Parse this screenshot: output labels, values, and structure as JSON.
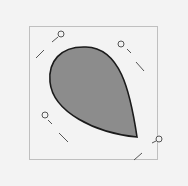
{
  "canvas": {
    "background": "#f3f3f3",
    "bounding_box": {
      "x": 29.5,
      "y": 26.5,
      "w": 128,
      "h": 133,
      "stroke": "#8a8a8a"
    },
    "shape": {
      "name": "teardrop",
      "fill": "#8c8c8c",
      "stroke": "#1a1a1a",
      "path": "M137,137 C130,90 120,48 86,47 C60,46 48,62 50,82 C53,112 95,133 137,137 Z"
    },
    "handles": [
      {
        "name": "handle-top-left",
        "line": [
          36,
          58,
          44,
          50
        ],
        "line2": [
          52,
          42,
          58,
          37
        ],
        "knob": [
          61,
          34
        ]
      },
      {
        "name": "handle-top-right",
        "line": [
          127,
          49,
          131,
          53
        ],
        "line2": [
          136,
          62,
          144,
          71
        ],
        "knob": [
          121,
          44
        ]
      },
      {
        "name": "handle-bottom-left",
        "line": [
          48,
          120,
          52,
          124
        ],
        "line2": [
          59,
          133,
          68,
          142
        ],
        "knob": [
          45,
          115
        ]
      },
      {
        "name": "handle-bottom-right",
        "line": [
          152,
          143,
          156,
          141
        ],
        "line2": [
          134,
          160,
          142,
          153
        ],
        "knob": [
          159,
          139
        ]
      }
    ]
  }
}
